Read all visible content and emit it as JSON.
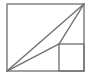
{
  "diagram": {
    "type": "geometric-figure",
    "stroke_color": "#6e6e6e",
    "background": "#ffffff",
    "outer_rectangle": {
      "x": 7,
      "y": 4,
      "width": 77,
      "height": 67
    },
    "inner_square": {
      "x": 59,
      "y": 44,
      "width": 25,
      "height": 27
    },
    "points": {
      "bottom_left": [
        7,
        71
      ],
      "top_right": [
        84,
        4
      ],
      "inner_corner": [
        59,
        44
      ]
    },
    "segments": [
      {
        "name": "main-diagonal",
        "from": "bottom_left",
        "to": "top_right"
      },
      {
        "name": "lower-segment-to-inner",
        "from": "bottom_left",
        "to": "inner_corner"
      },
      {
        "name": "inner-to-top-right",
        "from": "inner_corner",
        "to": "top_right"
      }
    ]
  }
}
